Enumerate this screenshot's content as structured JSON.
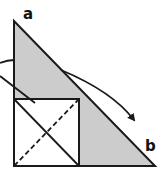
{
  "diagram": {
    "labels": {
      "a": "a",
      "b": "b"
    },
    "colors": {
      "triangle_fill": "#cccccc",
      "square_fill": "#ffffff",
      "stroke": "#1a1a1a",
      "background": "#ffffff"
    }
  }
}
